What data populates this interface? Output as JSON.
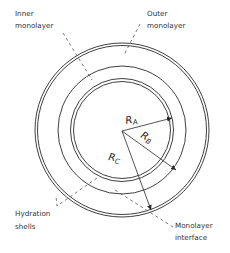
{
  "diagram": {
    "labels": {
      "inner_monolayer": [
        "Inner",
        "monolayer"
      ],
      "outer_monolayer": [
        "Outer",
        "monolayer"
      ],
      "hydration_shells": [
        "Hydration",
        "shells"
      ],
      "monolayer_interface": [
        "Monolayer",
        "interface"
      ]
    },
    "radii": {
      "a": {
        "symbol": "R",
        "subscript": "A"
      },
      "b": {
        "symbol": "R",
        "subscript": "B"
      },
      "c": {
        "symbol": "R",
        "subscript": "C"
      }
    },
    "colors": {
      "line": "#2a2a2a",
      "text": "#333333",
      "background": "#ffffff"
    }
  }
}
